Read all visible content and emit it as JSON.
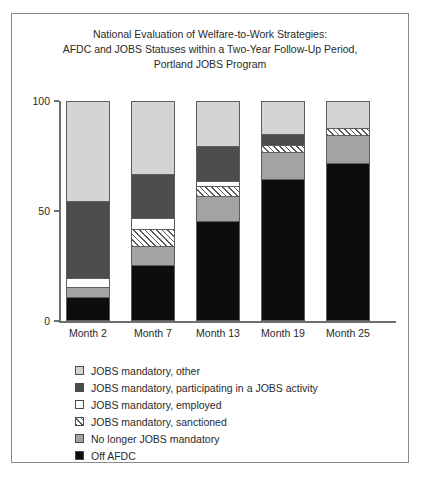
{
  "figure": {
    "title_lines": [
      "National Evaluation of Welfare-to-Work Strategies:",
      "AFDC and JOBS Statuses within a Two-Year Follow-Up Period,",
      "Portland JOBS Program"
    ]
  },
  "chart_data": {
    "type": "bar",
    "subtype": "stacked-vertical-100-percent",
    "title": "National Evaluation of Welfare-to-Work Strategies: AFDC and JOBS Statuses within a Two-Year Follow-Up Period, Portland JOBS Program",
    "xlabel": "",
    "ylabel": "Percent",
    "ylim": [
      0,
      100
    ],
    "yticks": [
      0,
      50,
      100
    ],
    "ytick_labels": [
      "0",
      "50",
      "100"
    ],
    "grid": false,
    "legend_position": "below-plot",
    "categories": [
      "Month 2",
      "Month 7",
      "Month 13",
      "Month 19",
      "Month 25"
    ],
    "stack_order_bottom_to_top": [
      "Off AFDC",
      "No longer JOBS mandatory",
      "JOBS mandatory, sanctioned",
      "JOBS mandatory, employed",
      "JOBS mandatory, participating in a JOBS activity",
      "JOBS mandatory, other"
    ],
    "series": [
      {
        "name": "Off AFDC",
        "swatch": "solid-black",
        "color": "#0d0d0d",
        "values": [
          10.0,
          25.0,
          45.0,
          64.0,
          71.5
        ]
      },
      {
        "name": "No longer JOBS mandatory",
        "swatch": "solid-medium-gray",
        "color": "#a3a3a3",
        "values": [
          4.5,
          8.5,
          11.5,
          12.5,
          13.0
        ]
      },
      {
        "name": "JOBS mandatory, sanctioned",
        "swatch": "diagonal-hatch",
        "color": "#ffffff",
        "values": [
          0.0,
          8.0,
          4.5,
          3.5,
          3.0
        ]
      },
      {
        "name": "JOBS mandatory, employed",
        "swatch": "solid-white",
        "color": "#ffffff",
        "values": [
          4.5,
          5.0,
          2.5,
          0.0,
          0.0
        ]
      },
      {
        "name": "JOBS mandatory, participating in a JOBS activity",
        "swatch": "solid-dark-gray",
        "color": "#4d4d4d",
        "values": [
          35.0,
          20.0,
          16.0,
          5.0,
          0.0
        ]
      },
      {
        "name": "JOBS mandatory, other",
        "swatch": "solid-light-gray",
        "color": "#d4d4d4",
        "values": [
          46.0,
          33.5,
          20.5,
          15.0,
          12.5
        ]
      }
    ]
  },
  "legend": {
    "items": [
      {
        "label": "JOBS mandatory, other",
        "swatch_class": "sw-other"
      },
      {
        "label": "JOBS mandatory, participating in a JOBS activity",
        "swatch_class": "sw-participating"
      },
      {
        "label": "JOBS mandatory, employed",
        "swatch_class": "sw-employed"
      },
      {
        "label": "JOBS mandatory, sanctioned",
        "swatch_class": "sw-sanctioned"
      },
      {
        "label": "No longer JOBS mandatory",
        "swatch_class": "sw-nolonger"
      },
      {
        "label": "Off AFDC",
        "swatch_class": "sw-offafdc"
      }
    ]
  }
}
